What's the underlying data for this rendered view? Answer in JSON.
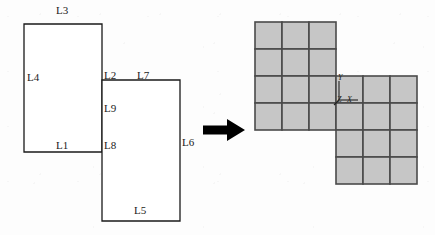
{
  "figure": {
    "arrow": {
      "name": "right-arrow",
      "direction": "right",
      "color": "#000000"
    }
  },
  "sketch": {
    "name": "labelled-profile-sketch",
    "stroke_color": "#1a1a1a",
    "fill_color": "#ffffff",
    "upper_rect": {
      "x": 24,
      "y": 24,
      "w": 78,
      "h": 128
    },
    "lower_rect": {
      "x": 102,
      "y": 80,
      "w": 78,
      "h": 141
    },
    "labels": [
      {
        "id": "L3",
        "text": "L3",
        "x": 56,
        "y": 9,
        "edge": "top-of-upper-rect"
      },
      {
        "id": "L4",
        "text": "L4",
        "x": 27,
        "y": 76,
        "edge": "left-of-upper-rect"
      },
      {
        "id": "L1",
        "text": "L1",
        "x": 56,
        "y": 143,
        "edge": "bottom-of-upper-rect"
      },
      {
        "id": "L2",
        "text": "L2",
        "x": 104,
        "y": 74,
        "edge": "upper-right-vertical"
      },
      {
        "id": "L7",
        "text": "L7",
        "x": 138,
        "y": 74,
        "edge": "top-of-lower-rect"
      },
      {
        "id": "L9",
        "text": "L9",
        "x": 104,
        "y": 106,
        "edge": "shared-vertical"
      },
      {
        "id": "L8",
        "text": "L8",
        "x": 104,
        "y": 143,
        "edge": "junction-corner"
      },
      {
        "id": "L6",
        "text": "L6",
        "x": 182,
        "y": 140,
        "edge": "right-of-lower-rect"
      },
      {
        "id": "L5",
        "text": "L5",
        "x": 135,
        "y": 208,
        "edge": "bottom-of-lower-rect"
      }
    ]
  },
  "voxel_grid": {
    "name": "voxel-grid-result",
    "cell_size": 27,
    "columns": 6,
    "rows": 6,
    "fill_color": "#c6c6c6",
    "stroke_color": "#4a4a4a",
    "blocks": [
      {
        "name": "upper-left-block",
        "col": 0,
        "row": 0,
        "cols": 3,
        "rows": 4
      },
      {
        "name": "lower-right-block",
        "col": 3,
        "row": 2,
        "cols": 3,
        "rows": 4
      }
    ],
    "triad": {
      "name": "coordinate-triad",
      "origin_col": 3,
      "origin_row": 2,
      "axes": [
        {
          "id": "x",
          "label": "X"
        },
        {
          "id": "y",
          "label": "Y"
        },
        {
          "id": "z",
          "label": "Z"
        }
      ]
    }
  }
}
